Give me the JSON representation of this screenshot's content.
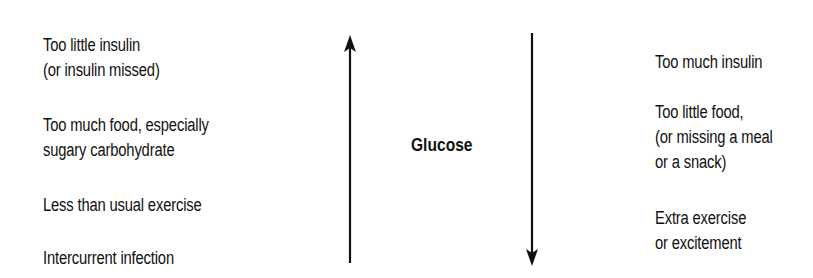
{
  "diagram": {
    "center_label": "Glucose",
    "increase": {
      "direction": "up",
      "causes": [
        {
          "lines": [
            "Too little insulin",
            "(or insulin missed)"
          ]
        },
        {
          "lines": [
            "Too much food, especially",
            "sugary carbohydrate"
          ]
        },
        {
          "lines": [
            "Less than usual exercise"
          ]
        },
        {
          "lines": [
            "Intercurrent infection"
          ]
        }
      ]
    },
    "decrease": {
      "direction": "down",
      "causes": [
        {
          "lines": [
            "Too much insulin"
          ]
        },
        {
          "lines": [
            "Too little food,",
            "(or missing a meal",
            "or a snack)"
          ]
        },
        {
          "lines": [
            "Extra exercise",
            "or excitement"
          ]
        }
      ]
    },
    "colors": {
      "ink": "#111111",
      "background": "#ffffff"
    }
  }
}
